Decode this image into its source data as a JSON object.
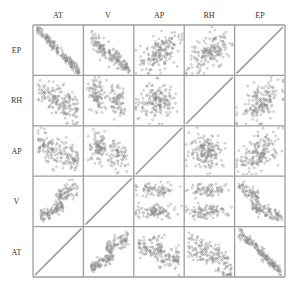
{
  "chart_data": {
    "type": "scatter",
    "title": "",
    "layout": "scatter-matrix",
    "variables_columns": [
      "AT",
      "V",
      "AP",
      "RH",
      "EP"
    ],
    "variables_rows": [
      "EP",
      "RH",
      "AP",
      "V",
      "AT"
    ],
    "diagonal": "identity-line",
    "grid": true,
    "point_color": "#8a8a8a",
    "line_color": "#9a9a9a",
    "frame_color": "#9e9e9e",
    "cells": [
      {
        "row": "EP",
        "col": "AT",
        "pattern": "strong-negative",
        "r": -0.95
      },
      {
        "row": "EP",
        "col": "V",
        "pattern": "negative-two-clusters",
        "r": -0.87
      },
      {
        "row": "EP",
        "col": "AP",
        "pattern": "weak-positive",
        "r": 0.52
      },
      {
        "row": "EP",
        "col": "RH",
        "pattern": "weak-positive",
        "r": 0.39
      },
      {
        "row": "EP",
        "col": "EP",
        "pattern": "diagonal"
      },
      {
        "row": "RH",
        "col": "AT",
        "pattern": "weak-negative",
        "r": -0.54
      },
      {
        "row": "RH",
        "col": "V",
        "pattern": "weak-negative-clusters",
        "r": -0.31
      },
      {
        "row": "RH",
        "col": "AP",
        "pattern": "none",
        "r": 0.1
      },
      {
        "row": "RH",
        "col": "RH",
        "pattern": "diagonal"
      },
      {
        "row": "RH",
        "col": "EP",
        "pattern": "weak-positive",
        "r": 0.39
      },
      {
        "row": "AP",
        "col": "AT",
        "pattern": "negative",
        "r": -0.51
      },
      {
        "row": "AP",
        "col": "V",
        "pattern": "negative-clusters",
        "r": -0.41
      },
      {
        "row": "AP",
        "col": "AP",
        "pattern": "diagonal"
      },
      {
        "row": "AP",
        "col": "RH",
        "pattern": "none",
        "r": 0.1
      },
      {
        "row": "AP",
        "col": "EP",
        "pattern": "weak-positive",
        "r": 0.52
      },
      {
        "row": "V",
        "col": "AT",
        "pattern": "positive-two-clusters",
        "r": 0.84
      },
      {
        "row": "V",
        "col": "V",
        "pattern": "diagonal"
      },
      {
        "row": "V",
        "col": "AP",
        "pattern": "two-bands",
        "r": -0.41
      },
      {
        "row": "V",
        "col": "RH",
        "pattern": "two-bands",
        "r": -0.31
      },
      {
        "row": "V",
        "col": "EP",
        "pattern": "negative-two-bands",
        "r": -0.87
      },
      {
        "row": "AT",
        "col": "AT",
        "pattern": "diagonal"
      },
      {
        "row": "AT",
        "col": "V",
        "pattern": "positive-two-clusters",
        "r": 0.84
      },
      {
        "row": "AT",
        "col": "AP",
        "pattern": "negative",
        "r": -0.51
      },
      {
        "row": "AT",
        "col": "RH",
        "pattern": "negative-curved",
        "r": -0.54
      },
      {
        "row": "AT",
        "col": "EP",
        "pattern": "strong-negative",
        "r": -0.95
      }
    ]
  }
}
